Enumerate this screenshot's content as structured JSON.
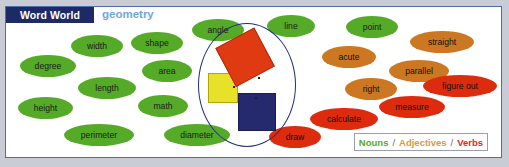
{
  "header": {
    "title": "Word World",
    "subject": "geometry"
  },
  "legend": {
    "nouns": "Nouns",
    "adjectives": "Adjectives",
    "verbs": "Verbs",
    "separator": "/",
    "noun_color": "#55aa28",
    "adjective_color": "#d79a3c",
    "verb_color": "#dd2b0e"
  },
  "words": [
    {
      "label": "width",
      "type": "noun",
      "x": 65,
      "y": 28,
      "w": 52,
      "h": 22
    },
    {
      "label": "shape",
      "type": "noun",
      "x": 125,
      "y": 25,
      "w": 52,
      "h": 22
    },
    {
      "label": "degree",
      "type": "noun",
      "x": 14,
      "y": 48,
      "w": 56,
      "h": 22
    },
    {
      "label": "area",
      "type": "noun",
      "x": 136,
      "y": 53,
      "w": 50,
      "h": 22
    },
    {
      "label": "length",
      "type": "noun",
      "x": 72,
      "y": 70,
      "w": 58,
      "h": 22
    },
    {
      "label": "height",
      "type": "noun",
      "x": 12,
      "y": 90,
      "w": 55,
      "h": 22
    },
    {
      "label": "math",
      "type": "noun",
      "x": 132,
      "y": 88,
      "w": 50,
      "h": 22
    },
    {
      "label": "perimeter",
      "type": "noun",
      "x": 58,
      "y": 117,
      "w": 70,
      "h": 22
    },
    {
      "label": "diameter",
      "type": "noun",
      "x": 158,
      "y": 117,
      "w": 66,
      "h": 22
    },
    {
      "label": "angle",
      "type": "noun",
      "x": 186,
      "y": 12,
      "w": 52,
      "h": 22
    },
    {
      "label": "line",
      "type": "noun",
      "x": 261,
      "y": 8,
      "w": 48,
      "h": 22
    },
    {
      "label": "point",
      "type": "noun",
      "x": 340,
      "y": 9,
      "w": 52,
      "h": 22
    },
    {
      "label": "straight",
      "type": "adj",
      "x": 404,
      "y": 24,
      "w": 64,
      "h": 22
    },
    {
      "label": "acute",
      "type": "adj",
      "x": 316,
      "y": 39,
      "w": 54,
      "h": 22
    },
    {
      "label": "parallel",
      "type": "adj",
      "x": 383,
      "y": 53,
      "w": 60,
      "h": 22
    },
    {
      "label": "right",
      "type": "adj",
      "x": 339,
      "y": 71,
      "w": 52,
      "h": 22
    },
    {
      "label": "figure out",
      "type": "verb",
      "x": 417,
      "y": 68,
      "w": 74,
      "h": 22
    },
    {
      "label": "measure",
      "type": "verb",
      "x": 373,
      "y": 89,
      "w": 66,
      "h": 22
    },
    {
      "label": "calculate",
      "type": "verb",
      "x": 304,
      "y": 101,
      "w": 68,
      "h": 22
    },
    {
      "label": "draw",
      "type": "verb",
      "x": 263,
      "y": 119,
      "w": 52,
      "h": 22
    }
  ],
  "diagram": {
    "name": "pythagorean-theorem-figure",
    "ellipse_color": "#1f2f7a",
    "square_yellow_color": "#e8e12a",
    "square_red_color": "#e03a12",
    "square_navy_color": "#252a6e"
  }
}
